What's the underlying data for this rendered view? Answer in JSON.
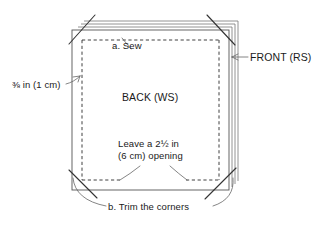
{
  "diagram": {
    "type": "sewing-instruction-diagram",
    "background_color": "#ffffff",
    "ink_color": "#1a1a1a",
    "line_color": "#555555",
    "labels": {
      "seam_allowance": "⅜ in (1 cm)",
      "sew_step": "a. Sew",
      "front_piece": "FRONT (RS)",
      "back_piece": "BACK (WS)",
      "opening_line1": "Leave a 2½ in",
      "opening_line2": "(6 cm) opening",
      "trim_step": "b. Trim the corners"
    },
    "measurements": {
      "seam_allowance_imperial": "⅜ in",
      "seam_allowance_metric": "1 cm",
      "opening_imperial": "2½ in",
      "opening_metric": "6 cm"
    },
    "steps": [
      {
        "key": "a",
        "label": "a. Sew"
      },
      {
        "key": "b",
        "label": "b. Trim the corners"
      }
    ],
    "fabric_layers": {
      "count": 4,
      "offset_px": 4,
      "note": "Stacked fabric edges shown offset at top and right"
    },
    "stitch_line": {
      "style": "dashed",
      "has_opening_gap": true,
      "gap_edge": "bottom"
    },
    "trim_marks": {
      "count": 4,
      "corners": [
        "top-left",
        "top-right",
        "bottom-left",
        "bottom-right"
      ]
    }
  }
}
